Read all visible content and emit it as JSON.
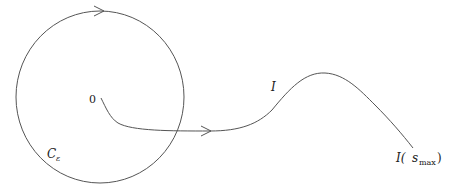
{
  "diagram": {
    "labels": {
      "origin": "0",
      "path": "I",
      "circle_main": "C",
      "circle_sub": "ε",
      "endpoint_main": "I(",
      "endpoint_sub": "max",
      "endpoint_s": "s",
      "endpoint_close": ")"
    },
    "elements": [
      {
        "id": "circle",
        "kind": "circle contour",
        "label": "C_ε",
        "arrow": "clockwise at top"
      },
      {
        "id": "path",
        "kind": "curve",
        "label": "I",
        "from": "0",
        "to": "I(s_max)",
        "arrow": "rightward after exiting circle"
      }
    ],
    "colors": {
      "stroke": "#555555",
      "text": "#222222",
      "background": "#ffffff"
    }
  }
}
